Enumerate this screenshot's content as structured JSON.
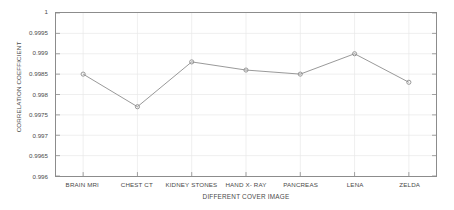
{
  "chart_data": {
    "type": "line",
    "title": "",
    "xlabel": "DIFFERENT COVER IMAGE",
    "ylabel": "CORRELATION COEFFICIENT",
    "categories": [
      "BRAIN MRI",
      "CHEST CT",
      "KIDNEY STONES",
      "HAND X- RAY",
      "PANCREAS",
      "LENA",
      "ZELDA"
    ],
    "values": [
      0.9985,
      0.9977,
      0.9988,
      0.9986,
      0.9985,
      0.999,
      0.9983
    ],
    "ylim": [
      0.996,
      1
    ],
    "ytick_labels": [
      "1",
      "0.9995",
      "0.999",
      "0.9985",
      "0.998",
      "0.9975",
      "0.997",
      "0.9965",
      "0.996"
    ],
    "ytick_values": [
      1,
      0.9995,
      0.999,
      0.9985,
      0.998,
      0.9975,
      0.997,
      0.9965,
      0.996
    ],
    "grid": true,
    "legend": null,
    "marker": "circle",
    "line_color": "#8c8c8c",
    "marker_color": "#8c8c8c",
    "grid_color": "#e8e8e8",
    "axis_color": "#8c8c8c",
    "text_color": "#4a4a4a"
  }
}
